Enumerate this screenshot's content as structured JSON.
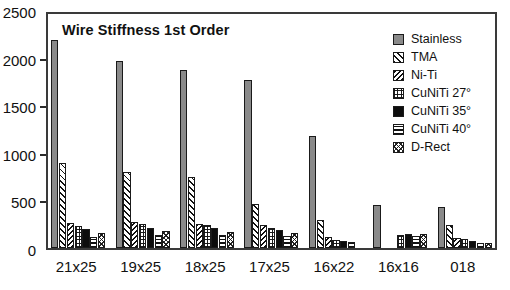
{
  "chart_data": {
    "type": "bar",
    "title": "Wire Stiffness 1st Order",
    "xlabel": "",
    "ylabel": "",
    "ylim": [
      0,
      2500
    ],
    "yticks": [
      0,
      500,
      1000,
      1500,
      2000,
      2500
    ],
    "ytick_labels": [
      "0",
      "500",
      "1000",
      "1500",
      "2000",
      "2500"
    ],
    "grid": false,
    "legend_position": "top-right",
    "categories": [
      "21x25",
      "19x25",
      "18x25",
      "17x25",
      "16x22",
      "16x16",
      "018"
    ],
    "series": [
      {
        "name": "Stainless",
        "pattern": "solid-gray",
        "values": [
          2180,
          1960,
          1870,
          1770,
          1180,
          450,
          430
        ]
      },
      {
        "name": "TMA",
        "pattern": "diagonal-up",
        "values": [
          890,
          800,
          745,
          465,
          290,
          0,
          245
        ]
      },
      {
        "name": "Ni-Ti",
        "pattern": "diagonal-down",
        "values": [
          265,
          270,
          255,
          245,
          120,
          0,
          110
        ]
      },
      {
        "name": "CuNiTi 27°",
        "pattern": "grid-dots",
        "values": [
          235,
          250,
          240,
          215,
          85,
          140,
          95
        ]
      },
      {
        "name": "CuNiTi 35°",
        "pattern": "solid-black",
        "values": [
          195,
          215,
          210,
          185,
          75,
          150,
          70
        ]
      },
      {
        "name": "CuNiTi 40°",
        "pattern": "horizontal",
        "values": [
          115,
          135,
          140,
          130,
          65,
          130,
          55
        ]
      },
      {
        "name": "D-Rect",
        "pattern": "crosshatch",
        "values": [
          160,
          180,
          170,
          155,
          0,
          145,
          50
        ]
      }
    ]
  },
  "legend": {
    "items": [
      {
        "label": "Stainless"
      },
      {
        "label": "TMA"
      },
      {
        "label": "Ni-Ti"
      },
      {
        "label": "CuNiTi 27°"
      },
      {
        "label": "CuNiTi 35°"
      },
      {
        "label": "CuNiTi 40°"
      },
      {
        "label": "D-Rect"
      }
    ]
  }
}
